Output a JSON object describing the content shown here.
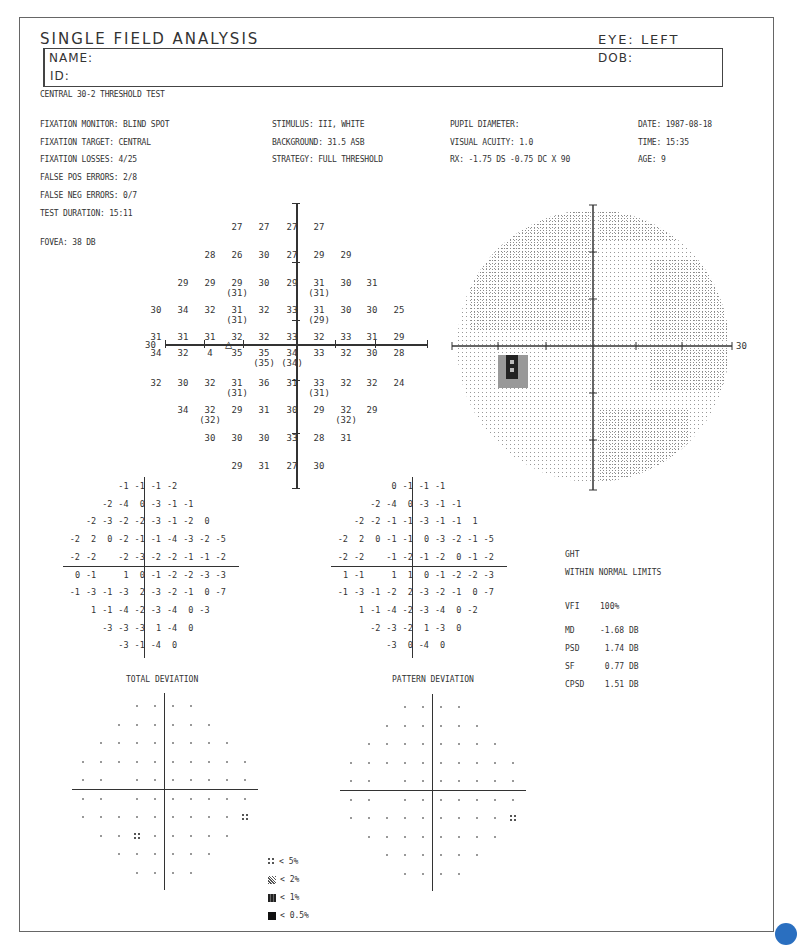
{
  "header": {
    "title": "SINGLE FIELD ANALYSIS",
    "eye_label": "EYE: LEFT",
    "name_label": "NAME:",
    "id_label": "ID:",
    "dob_label": "DOB:"
  },
  "test_name": "CENTRAL 30-2 THRESHOLD TEST",
  "params_left": [
    "FIXATION MONITOR: BLIND SPOT",
    "FIXATION TARGET: CENTRAL",
    "FIXATION LOSSES: 4/25",
    "FALSE POS ERRORS: 2/8",
    "FALSE NEG ERRORS: 0/7",
    "TEST DURATION: 15:11"
  ],
  "fovea": "FOVEA: 38 DB",
  "params_mid": [
    "STIMULUS: III, WHITE",
    "BACKGROUND: 31.5 ASB",
    "STRATEGY: FULL THRESHOLD"
  ],
  "params_right1": [
    "PUPIL DIAMETER:",
    "VISUAL ACUITY: 1.0",
    "RX: -1.75 DS  -0.75 DC  X  90"
  ],
  "params_right2": [
    "DATE: 1987-08-18",
    "TIME: 15:35",
    "AGE: 9"
  ],
  "axis_label_left": "30",
  "axis_label_right": "30",
  "threshold_rows": [
    {
      "y": 226,
      "cells": [
        {
          "c": 3,
          "v": "27"
        },
        {
          "c": 4,
          "v": "27"
        },
        {
          "c": 5,
          "v": "27"
        },
        {
          "c": 6,
          "v": "27"
        }
      ]
    },
    {
      "y": 254,
      "cells": [
        {
          "c": 2,
          "v": "28"
        },
        {
          "c": 3,
          "v": "26"
        },
        {
          "c": 4,
          "v": "30"
        },
        {
          "c": 5,
          "v": "27"
        },
        {
          "c": 6,
          "v": "29"
        },
        {
          "c": 7,
          "v": "29"
        }
      ]
    },
    {
      "y": 282,
      "cells": [
        {
          "c": 1,
          "v": "29"
        },
        {
          "c": 2,
          "v": "29"
        },
        {
          "c": 3,
          "v": "29",
          "p": "(31)"
        },
        {
          "c": 4,
          "v": "30"
        },
        {
          "c": 5,
          "v": "29"
        },
        {
          "c": 6,
          "v": "31",
          "p": "(31)"
        },
        {
          "c": 7,
          "v": "30"
        },
        {
          "c": 8,
          "v": "31"
        }
      ]
    },
    {
      "y": 309,
      "cells": [
        {
          "c": 0,
          "v": "30"
        },
        {
          "c": 1,
          "v": "34"
        },
        {
          "c": 2,
          "v": "32"
        },
        {
          "c": 3,
          "v": "31",
          "p": "(31)"
        },
        {
          "c": 4,
          "v": "32"
        },
        {
          "c": 5,
          "v": "33"
        },
        {
          "c": 6,
          "v": "31",
          "p": "(29)"
        },
        {
          "c": 7,
          "v": "30"
        },
        {
          "c": 8,
          "v": "30"
        },
        {
          "c": 9,
          "v": "25"
        }
      ]
    },
    {
      "y": 336,
      "cells": [
        {
          "c": 0,
          "v": "31"
        },
        {
          "c": 1,
          "v": "31"
        },
        {
          "c": 2,
          "v": "31"
        },
        {
          "c": 3,
          "v": "32"
        },
        {
          "c": 4,
          "v": "32"
        },
        {
          "c": 5,
          "v": "33"
        },
        {
          "c": 6,
          "v": "32"
        },
        {
          "c": 7,
          "v": "33"
        },
        {
          "c": 8,
          "v": "31"
        },
        {
          "c": 9,
          "v": "29"
        }
      ]
    },
    {
      "y": 352,
      "cells": [
        {
          "c": 0,
          "v": "34"
        },
        {
          "c": 1,
          "v": "32"
        },
        {
          "c": 2,
          "v": "4"
        },
        {
          "c": 3,
          "v": "35"
        },
        {
          "c": 4,
          "v": "35",
          "p": "(35)"
        },
        {
          "c": 5,
          "v": "34",
          "p": "(34)"
        },
        {
          "c": 6,
          "v": "33"
        },
        {
          "c": 7,
          "v": "32"
        },
        {
          "c": 8,
          "v": "30"
        },
        {
          "c": 9,
          "v": "28"
        }
      ]
    },
    {
      "y": 382,
      "cells": [
        {
          "c": 0,
          "v": "32"
        },
        {
          "c": 1,
          "v": "30"
        },
        {
          "c": 2,
          "v": "32"
        },
        {
          "c": 3,
          "v": "31",
          "p": "(31)"
        },
        {
          "c": 4,
          "v": "36"
        },
        {
          "c": 5,
          "v": "31"
        },
        {
          "c": 6,
          "v": "33",
          "p": "(31)"
        },
        {
          "c": 7,
          "v": "32"
        },
        {
          "c": 8,
          "v": "32"
        },
        {
          "c": 9,
          "v": "24"
        }
      ]
    },
    {
      "y": 409,
      "cells": [
        {
          "c": 1,
          "v": "34"
        },
        {
          "c": 2,
          "v": "32",
          "p": "(32)"
        },
        {
          "c": 3,
          "v": "29"
        },
        {
          "c": 4,
          "v": "31"
        },
        {
          "c": 5,
          "v": "30"
        },
        {
          "c": 6,
          "v": "29"
        },
        {
          "c": 7,
          "v": "32",
          "p": "(32)"
        },
        {
          "c": 8,
          "v": "29"
        }
      ]
    },
    {
      "y": 437,
      "cells": [
        {
          "c": 2,
          "v": "30"
        },
        {
          "c": 3,
          "v": "30"
        },
        {
          "c": 4,
          "v": "30"
        },
        {
          "c": 5,
          "v": "33"
        },
        {
          "c": 6,
          "v": "28"
        },
        {
          "c": 7,
          "v": "31"
        }
      ]
    },
    {
      "y": 465,
      "cells": [
        {
          "c": 3,
          "v": "29"
        },
        {
          "c": 4,
          "v": "31"
        },
        {
          "c": 5,
          "v": "27"
        },
        {
          "c": 6,
          "v": "30"
        }
      ]
    }
  ],
  "total_deviation": {
    "title": "TOTAL DEVIATION",
    "rows": [
      [
        "",
        "",
        "",
        "-1",
        "-1",
        "-1",
        "-2",
        "",
        "",
        ""
      ],
      [
        "",
        "",
        "-2",
        "-4",
        "0",
        "-3",
        "-1",
        "-1",
        "",
        ""
      ],
      [
        "",
        "-2",
        "-3",
        "-2",
        "-2",
        "-3",
        "-1",
        "-2",
        "0",
        ""
      ],
      [
        "-2",
        "2",
        "0",
        "-2",
        "-1",
        "-1",
        "-4",
        "-3",
        "-2",
        "-5"
      ],
      [
        "-2",
        "-2",
        "",
        "-2",
        "-3",
        "-2",
        "-2",
        "-1",
        "-1",
        "-2"
      ],
      [
        "0",
        "-1",
        "",
        "1",
        "0",
        "-1",
        "-2",
        "-2",
        "-3",
        "-3"
      ],
      [
        "-1",
        "-3",
        "-1",
        "-3",
        "2",
        "-3",
        "-2",
        "-1",
        "0",
        "-7"
      ],
      [
        "",
        "1",
        "-1",
        "-4",
        "-2",
        "-3",
        "-4",
        "0",
        "-3",
        ""
      ],
      [
        "",
        "",
        "-3",
        "-3",
        "-3",
        "1",
        "-4",
        "0",
        "",
        ""
      ],
      [
        "",
        "",
        "",
        "-3",
        "-1",
        "-4",
        "0",
        "",
        "",
        ""
      ]
    ]
  },
  "pattern_deviation": {
    "title": "PATTERN DEVIATION",
    "rows": [
      [
        "",
        "",
        "",
        "0",
        "-1",
        "-1",
        "-1",
        "",
        "",
        ""
      ],
      [
        "",
        "",
        "-2",
        "-4",
        "0",
        "-3",
        "-1",
        "-1",
        "",
        ""
      ],
      [
        "",
        "-2",
        "-2",
        "-1",
        "-1",
        "-3",
        "-1",
        "-1",
        "1",
        ""
      ],
      [
        "-2",
        "2",
        "0",
        "-1",
        "-1",
        "0",
        "-3",
        "-2",
        "-1",
        "-5"
      ],
      [
        "-2",
        "-2",
        "",
        "-1",
        "-2",
        "-1",
        "-2",
        "0",
        "-1",
        "-2"
      ],
      [
        "1",
        "-1",
        "",
        "1",
        "1",
        "0",
        "-1",
        "-2",
        "-2",
        "-3"
      ],
      [
        "-1",
        "-3",
        "-1",
        "-2",
        "2",
        "-3",
        "-2",
        "-1",
        "0",
        "-7"
      ],
      [
        "",
        "1",
        "-1",
        "-4",
        "-2",
        "-3",
        "-4",
        "0",
        "-2",
        ""
      ],
      [
        "",
        "",
        "-2",
        "-3",
        "-2",
        "1",
        "-3",
        "0",
        "",
        ""
      ],
      [
        "",
        "",
        "",
        "-3",
        "0",
        "-4",
        "0",
        "",
        "",
        ""
      ]
    ]
  },
  "total_prob_flags": [
    [
      6,
      9
    ],
    [
      7,
      3
    ]
  ],
  "pattern_prob_flags": [
    [
      6,
      9
    ]
  ],
  "indices": {
    "ght_label": "GHT",
    "ght_value": "WITHIN NORMAL LIMITS",
    "rows": [
      {
        "k": "VFI",
        "v": "100%"
      },
      {
        "k": "MD",
        "v": "-1.68 DB"
      },
      {
        "k": "PSD",
        "v": " 1.74 DB"
      },
      {
        "k": "SF",
        "v": " 0.77 DB"
      },
      {
        "k": "CPSD",
        "v": " 1.51 DB"
      }
    ]
  },
  "legend": [
    {
      "symbol": "dots4",
      "label": "< 5%"
    },
    {
      "symbol": "swirl",
      "label": "< 2%"
    },
    {
      "symbol": "dense",
      "label": "< 1%"
    },
    {
      "symbol": "solid",
      "label": "< 0.5%"
    }
  ]
}
